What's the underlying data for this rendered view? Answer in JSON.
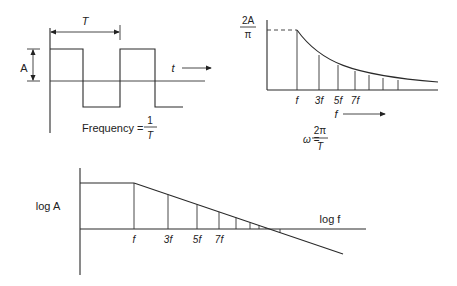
{
  "square_wave": {
    "period_label": "T",
    "amplitude_label": "A",
    "time_label": "t",
    "frequency_label": "Frequency =",
    "frequency_num": "1",
    "frequency_den": "T"
  },
  "spectrum": {
    "peak_num": "2A",
    "peak_den": "π",
    "harmonic_labels": [
      "f",
      "3f",
      "5f",
      "7f"
    ],
    "axis_label": "f",
    "omega_label": "ω =",
    "omega_num": "2π",
    "omega_den": "T"
  },
  "log_plot": {
    "y_label": "log A",
    "x_label": "log f",
    "harmonic_labels": [
      "f",
      "3f",
      "5f",
      "7f"
    ]
  },
  "colors": {
    "line": "#2a2a2a",
    "background": "#ffffff"
  }
}
